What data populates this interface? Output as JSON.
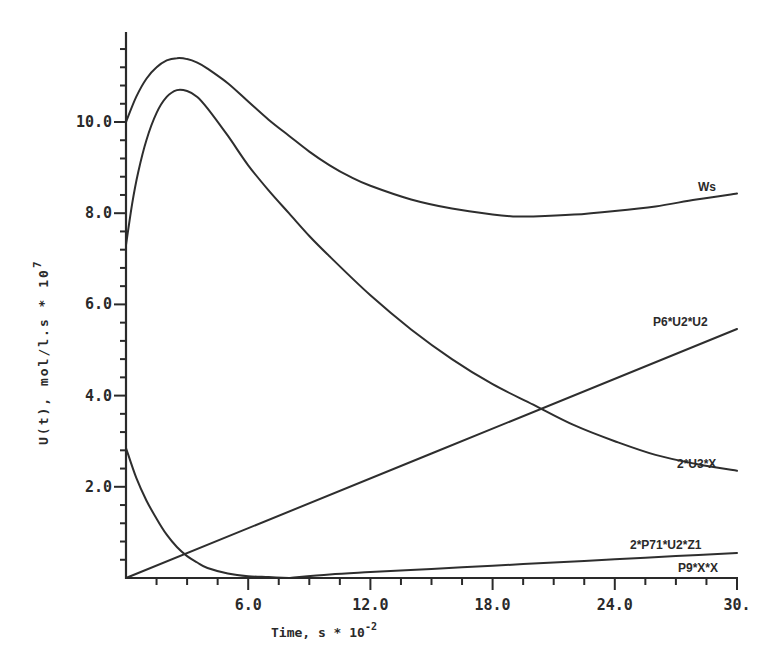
{
  "chart_data": {
    "type": "line",
    "title": "",
    "xlabel": "Time, s * 10^-2",
    "xlabel_parts": {
      "base": "Time, s * 10",
      "exponent": "-2"
    },
    "ylabel": "U(t), mol/l.s * 10^7",
    "ylabel_parts": {
      "base": "U(t), mol/l.s * 10",
      "exponent": "7"
    },
    "xlim": [
      0,
      30
    ],
    "ylim": [
      0,
      12
    ],
    "x_ticks": [
      6,
      12,
      18,
      24,
      30
    ],
    "x_tick_labels": [
      "6.0",
      "12.0",
      "18.0",
      "24.0",
      "30."
    ],
    "x_minor_step": 1.5,
    "y_ticks": [
      2,
      4,
      6,
      8,
      10
    ],
    "y_tick_labels": [
      "2.0",
      "4.0",
      "6.0",
      "8.0",
      "10.0"
    ],
    "y_minor_step": 0.4,
    "grid": false,
    "legend": "inline labels at right end of each curve",
    "series": [
      {
        "name": "Ws",
        "x": [
          0,
          0.5,
          1,
          1.5,
          2,
          2.5,
          3,
          3.5,
          4,
          5,
          6,
          7,
          8,
          9,
          10,
          11,
          12,
          14,
          16,
          18,
          19,
          20,
          22,
          24,
          26,
          28,
          30
        ],
        "values": [
          10.0,
          10.55,
          10.95,
          11.2,
          11.35,
          11.4,
          11.38,
          11.3,
          11.17,
          10.85,
          10.45,
          10.05,
          9.7,
          9.35,
          9.05,
          8.8,
          8.6,
          8.3,
          8.1,
          7.97,
          7.93,
          7.93,
          7.97,
          8.05,
          8.15,
          8.3,
          8.43
        ]
      },
      {
        "name": "2*U3*X",
        "x": [
          0,
          0.3,
          0.6,
          1,
          1.5,
          2,
          2.5,
          3,
          3.5,
          4,
          5,
          6,
          7,
          8,
          9,
          10,
          12,
          14,
          16,
          18,
          20,
          22,
          24,
          26,
          28,
          30
        ],
        "values": [
          7.3,
          8.2,
          8.9,
          9.6,
          10.2,
          10.55,
          10.7,
          10.68,
          10.55,
          10.3,
          9.7,
          9.05,
          8.5,
          8.0,
          7.5,
          7.05,
          6.2,
          5.45,
          4.8,
          4.25,
          3.8,
          3.35,
          3.0,
          2.7,
          2.5,
          2.35
        ]
      },
      {
        "name": "P6*U2*U2",
        "x": [
          0,
          30
        ],
        "values": [
          0.0,
          5.46
        ]
      },
      {
        "name": "P9*X*X",
        "x": [
          0,
          0.5,
          1,
          1.5,
          2,
          2.5,
          3,
          3.5,
          4,
          5,
          6,
          7,
          8
        ],
        "values": [
          2.85,
          2.2,
          1.7,
          1.3,
          0.95,
          0.68,
          0.48,
          0.34,
          0.22,
          0.1,
          0.04,
          0.02,
          0.0
        ]
      },
      {
        "name": "2*P71*U2*Z1",
        "x": [
          8,
          10,
          12,
          15,
          18,
          21,
          24,
          27,
          30
        ],
        "values": [
          0.0,
          0.08,
          0.13,
          0.2,
          0.27,
          0.34,
          0.41,
          0.48,
          0.55
        ]
      }
    ]
  },
  "series_labels": [
    {
      "text": "Ws",
      "x": 698,
      "y": 191
    },
    {
      "text": "P6*U2*U2",
      "x": 653,
      "y": 326
    },
    {
      "text": "2*U3*X",
      "x": 677,
      "y": 468
    },
    {
      "text": "2*P71*U2*Z1",
      "x": 630,
      "y": 549
    },
    {
      "text": "P9*X*X",
      "x": 678,
      "y": 572
    }
  ]
}
